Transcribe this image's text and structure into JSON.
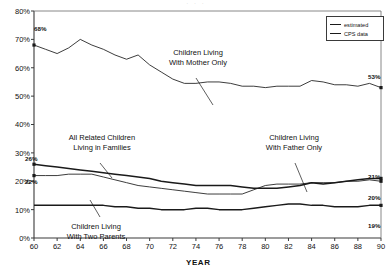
{
  "scan": {
    "top_artifact": "· · ·"
  },
  "legend": {
    "position": "top-right",
    "items": [
      {
        "label": "estimated",
        "style": "thin"
      },
      {
        "label": "CPS data",
        "style": "thick"
      }
    ]
  },
  "axes": {
    "ylabel": "",
    "xlabel": "YEAR",
    "yticks": [
      "0%",
      "10%",
      "20%",
      "30%",
      "40%",
      "50%",
      "60%",
      "70%",
      "80%"
    ],
    "xticks": [
      "60",
      "62",
      "64",
      "66",
      "68",
      "70",
      "72",
      "74",
      "76",
      "78",
      "80",
      "82",
      "84",
      "86",
      "88",
      "90"
    ]
  },
  "annotations": [
    {
      "id": "mother-only",
      "line1": "Children Living",
      "line2": "With Mother Only"
    },
    {
      "id": "all-related",
      "line1": "All Related Children",
      "line2": "Living in Families"
    },
    {
      "id": "father-only",
      "line1": "Children Living",
      "line2": "With Father Only"
    },
    {
      "id": "two-parents",
      "line1": "Children Living",
      "line2": "With Two Parents"
    }
  ],
  "point_labels": {
    "mother_start": "68%",
    "mother_end": "53%",
    "all_related_start": "26%",
    "two_parents_start": "22%",
    "all_related_end": "21%",
    "two_parents_end": "20%",
    "father_end": "19%"
  },
  "colors": {
    "line": "#1a1a1a",
    "axis": "#3a3a3a",
    "background": "#ffffff"
  },
  "chart_data": {
    "type": "line",
    "title": "",
    "subtitle": "",
    "xlabel": "YEAR",
    "ylabel": "",
    "xlim": [
      60,
      90
    ],
    "ylim": [
      0,
      80
    ],
    "grid": false,
    "legend_position": "top-right",
    "x": [
      60,
      61,
      62,
      63,
      64,
      65,
      66,
      67,
      68,
      69,
      70,
      71,
      72,
      73,
      74,
      75,
      76,
      77,
      78,
      79,
      80,
      81,
      82,
      83,
      84,
      85,
      86,
      87,
      88,
      89,
      90
    ],
    "series": [
      {
        "name": "Children Living With Mother Only",
        "style": "estimated",
        "start_label": "68%",
        "end_label": "53%",
        "values": [
          68,
          66.5,
          65,
          67,
          70,
          68,
          66.5,
          64.5,
          63,
          64.5,
          61,
          58.5,
          56,
          54.5,
          54.5,
          55,
          55,
          54.5,
          53.5,
          53.5,
          53,
          53.5,
          53.5,
          53.5,
          55.5,
          55,
          54,
          54,
          53.5,
          54.5,
          53
        ]
      },
      {
        "name": "All Related Children Living in Families",
        "style": "CPS data",
        "start_label": "26%",
        "end_label": "21%",
        "values": [
          26,
          25.5,
          25,
          24.5,
          24,
          23.5,
          23,
          22.5,
          22,
          21.5,
          21,
          20,
          19.5,
          19,
          18.5,
          18.5,
          18.5,
          18.5,
          18,
          17.5,
          17.5,
          17.5,
          18,
          18.5,
          19.5,
          19,
          19.5,
          20,
          20.5,
          21,
          21
        ]
      },
      {
        "name": "Children Living With Two Parents",
        "style": "estimated",
        "start_label": "22%",
        "end_label": "20%",
        "values": [
          22,
          22,
          22,
          22.5,
          22.5,
          22.5,
          21.5,
          20.5,
          19.5,
          18.5,
          18,
          17.5,
          17,
          16.5,
          16,
          15.5,
          15.5,
          15.5,
          15.5,
          17,
          18.5,
          19,
          19,
          19,
          19.5,
          19.5,
          19.5,
          20,
          20,
          20.5,
          20
        ]
      },
      {
        "name": "Children Living With Father Only",
        "style": "CPS data",
        "start_label": "",
        "end_label": "19%",
        "values": [
          11.5,
          11.5,
          11.5,
          11.5,
          11.5,
          11.5,
          11.5,
          11,
          11,
          10.5,
          10.5,
          10,
          10,
          10,
          10.5,
          10.5,
          10,
          10,
          10,
          10.5,
          11,
          11.5,
          12,
          12,
          11.5,
          11.5,
          11,
          11,
          11,
          11.5,
          11.5
        ]
      }
    ]
  }
}
